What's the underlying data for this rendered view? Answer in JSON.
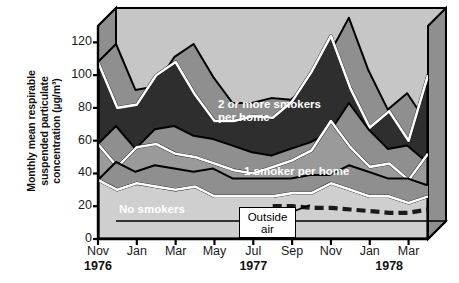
{
  "chart_data": {
    "type": "area",
    "title": "",
    "xlabel": "",
    "ylabel": "Monthly mean respirable suspended particulate concentration (µg/m³)",
    "ylabel_lines": [
      "Monthly mean respirable",
      "suspended particulate",
      "concentration (µg/m³)"
    ],
    "ylim": [
      0,
      130
    ],
    "yticks": [
      0,
      20,
      40,
      60,
      80,
      100,
      120
    ],
    "ytick_labels": [
      "0",
      "20",
      "40",
      "60",
      "80",
      "100",
      "120"
    ],
    "grid": false,
    "legend_position": "in-plot-annotations",
    "x": [
      "Nov 1976",
      "Dec 1976",
      "Jan 1977",
      "Feb 1977",
      "Mar 1977",
      "Apr 1977",
      "May 1977",
      "Jun 1977",
      "Jul 1977",
      "Aug 1977",
      "Sep 1977",
      "Oct 1977",
      "Nov 1977",
      "Dec 1977",
      "Jan 1978",
      "Feb 1978",
      "Mar 1978",
      "Apr 1978"
    ],
    "xtick_labels": [
      "Nov",
      "Jan",
      "Mar",
      "May",
      "Jul",
      "Sep",
      "Nov",
      "Jan",
      "Mar"
    ],
    "xtick_x": [
      "Nov 1976",
      "Jan 1977",
      "Mar 1977",
      "May 1977",
      "Jul 1977",
      "Sep 1977",
      "Nov 1977",
      "Jan 1978",
      "Mar 1978"
    ],
    "year_labels": [
      {
        "label": "1976",
        "at": "Nov 1976"
      },
      {
        "label": "1977",
        "at": "Jul 1977"
      },
      {
        "label": "1978",
        "at": "Feb 1978"
      }
    ],
    "series": [
      {
        "name": "2 or more smokers per home",
        "color": "#2e2e2e",
        "label_color": "#ffffff",
        "style": "area",
        "values": [
          108,
          80,
          82,
          100,
          108,
          88,
          72,
          72,
          75,
          74,
          84,
          102,
          124,
          92,
          68,
          78,
          60,
          100
        ]
      },
      {
        "name": "1 smoker per home",
        "color": "#9a9a9a",
        "label_color": "#ffffff",
        "style": "area",
        "values": [
          58,
          44,
          56,
          58,
          52,
          50,
          46,
          42,
          40,
          44,
          48,
          54,
          72,
          56,
          44,
          46,
          36,
          52
        ]
      },
      {
        "name": "No smokers",
        "color": "#cfcfcf",
        "label_color": "#ffffff",
        "style": "area",
        "values": [
          36,
          30,
          34,
          32,
          30,
          32,
          26,
          26,
          26,
          26,
          28,
          28,
          34,
          30,
          26,
          26,
          22,
          26
        ]
      },
      {
        "name": "Outside air",
        "color": "#1a1a1a",
        "label_color": "#000000",
        "style": "dashed-line",
        "values": [
          null,
          null,
          null,
          null,
          null,
          null,
          null,
          null,
          null,
          20,
          20,
          19,
          19,
          18,
          17,
          16,
          16,
          18
        ]
      }
    ],
    "annotations": [
      {
        "name": "2 or more smokers per home",
        "text": "2 or more smokers\nper home"
      },
      {
        "name": "1 smoker per home",
        "text": "1 smoker per home"
      },
      {
        "name": "No smokers",
        "text": "No smokers"
      },
      {
        "name": "Outside air",
        "text": "Outside\nair",
        "boxed": true,
        "line1": "Outside",
        "line2": "air"
      }
    ],
    "colors": {
      "plot_background": "#c6c6c6",
      "wall_shadow": "#8f8f8f",
      "axis": "#000000",
      "highlight_stroke": "#ffffff",
      "outline": "#000000"
    }
  }
}
